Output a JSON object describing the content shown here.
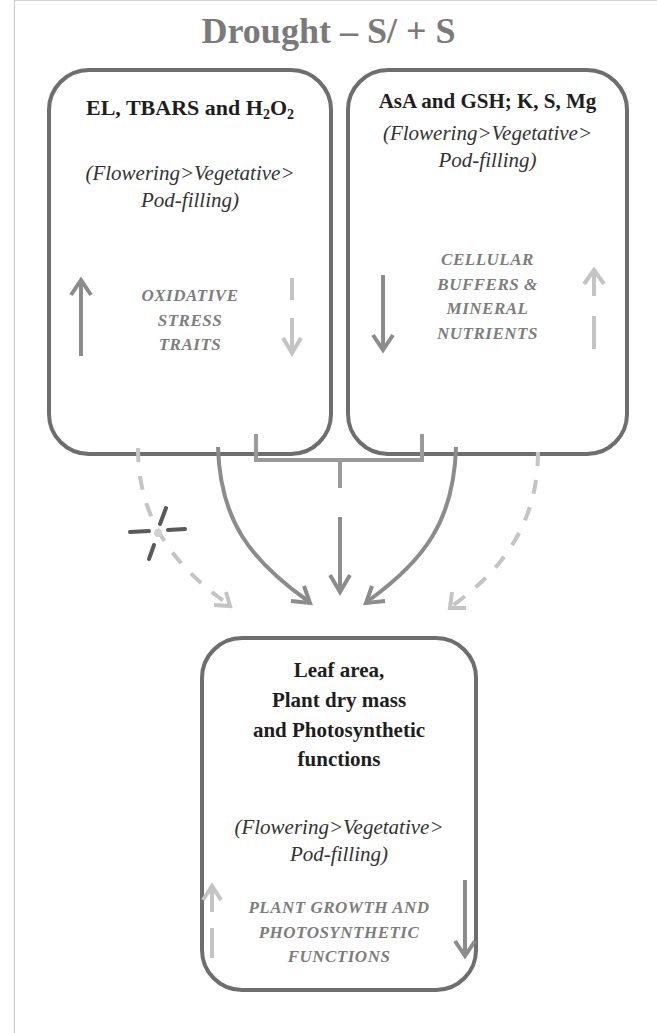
{
  "title": "Drought – S/ + S",
  "boxes": {
    "left": {
      "heading_main": "EL, TBARS and H",
      "heading_sub1": "2",
      "heading_mid": "O",
      "heading_sub2": "2",
      "stage_line1": "(Flowering>Vegetative>",
      "stage_line2": "Pod-filling)",
      "trait_lines": [
        "OXIDATIVE",
        "STRESS",
        "TRAITS"
      ],
      "arrow_solid": "up",
      "arrow_dashed": "down"
    },
    "right": {
      "heading": "AsA and GSH; K, S, Mg",
      "stage_line1": "(Flowering>Vegetative>",
      "stage_line2": "Pod-filling)",
      "trait_lines": [
        "CELLULAR",
        "BUFFERS &",
        "MINERAL",
        "NUTRIENTS"
      ],
      "arrow_solid": "down",
      "arrow_dashed": "up"
    },
    "bottom": {
      "heading_lines": [
        "Leaf area,",
        "Plant dry mass",
        "and Photosynthetic",
        "functions"
      ],
      "stage_line1": "(Flowering>Vegetative>",
      "stage_line2": "Pod-filling)",
      "trait_lines": [
        "PLANT GROWTH AND",
        "PHOTOSYNTHETIC",
        "FUNCTIONS"
      ],
      "arrow_solid": "down",
      "arrow_dashed": "up"
    }
  },
  "colors": {
    "title": "#7a7a7a",
    "box_border": "#6e6e6e",
    "solid_arrow": "#8c8c8c",
    "dashed_arrow": "#bdbdbd",
    "blocked_marker": "#5a5a5a"
  }
}
